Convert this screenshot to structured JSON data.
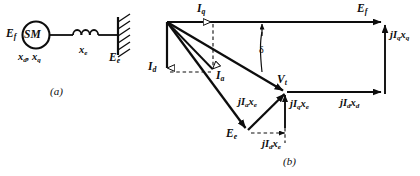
{
  "figure": {
    "stroke_color": "#0d0d0d",
    "background": "#ffffff"
  },
  "panel_a": {
    "tag": "(a)",
    "machine_symbol": "SM",
    "labels": {
      "ef": "E",
      "ef_sub": "f",
      "reactances": "x",
      "reactances_sub_d": "d",
      "reactances_mid": ", x",
      "reactances_sub_q": "q",
      "xe": "x",
      "xe_sub": "e",
      "ee": "E",
      "ee_sub": "e"
    },
    "icons": {
      "inductor": "inductor-coil-icon",
      "bus": "infinite-bus-icon",
      "machine": "synchronous-machine-circle-icon"
    }
  },
  "panel_b": {
    "tag": "(b)",
    "angle_label": "δ",
    "phasors": [
      {
        "name": "Iq",
        "base": "I",
        "sub": "q",
        "prefix": "",
        "full": "I_q"
      },
      {
        "name": "Id",
        "base": "I",
        "sub": "d",
        "prefix": "",
        "full": "I_d"
      },
      {
        "name": "Ia",
        "base": "I",
        "sub": "a",
        "prefix": "",
        "full": "I_a"
      },
      {
        "name": "Ef",
        "base": "E",
        "sub": "f",
        "prefix": "",
        "full": "E_f"
      },
      {
        "name": "Vt",
        "base": "V",
        "sub": "t",
        "prefix": "",
        "full": "V_t"
      },
      {
        "name": "Ee",
        "base": "E",
        "sub": "e",
        "prefix": "",
        "full": "E_e"
      },
      {
        "name": "jIqxq",
        "base": "I",
        "sub": "q",
        "prefix": "j",
        "suffix": "x",
        "suffix_sub": "q",
        "full": "jI_q x_q"
      },
      {
        "name": "jIdxd",
        "base": "I",
        "sub": "d",
        "prefix": "j",
        "suffix": "x",
        "suffix_sub": "d",
        "full": "jI_d x_d"
      },
      {
        "name": "jIaxe",
        "base": "I",
        "sub": "a",
        "prefix": "j",
        "suffix": "x",
        "suffix_sub": "e",
        "full": "jI_a x_e"
      },
      {
        "name": "jIqxe",
        "base": "I",
        "sub": "q",
        "prefix": "j",
        "suffix": "x",
        "suffix_sub": "e",
        "full": "jI_q x_e"
      },
      {
        "name": "jIdxe",
        "base": "I",
        "sub": "d",
        "prefix": "j",
        "suffix": "x",
        "suffix_sub": "e",
        "full": "jI_d x_e"
      }
    ],
    "text": {
      "iq": {
        "main": "I",
        "sub": "q"
      },
      "id": {
        "main": "I",
        "sub": "d"
      },
      "ia": {
        "main": "I",
        "sub": "a"
      },
      "ef": {
        "main": "E",
        "sub": "f"
      },
      "vt": {
        "main": "V",
        "sub": "t"
      },
      "ee": {
        "main": "E",
        "sub": "e"
      },
      "jiqxq": {
        "p": "jI",
        "s1": "q",
        "m": "x",
        "s2": "q"
      },
      "jidxd": {
        "p": "jI",
        "s1": "d",
        "m": "x",
        "s2": "d"
      },
      "jiaxe": {
        "p": "jI",
        "s1": "a",
        "m": "x",
        "s2": "e"
      },
      "jiqxe": {
        "p": "jI",
        "s1": "q",
        "m": "x",
        "s2": "e"
      },
      "jidxe": {
        "p": "jI",
        "s1": "d",
        "m": "x",
        "s2": "e"
      }
    }
  }
}
